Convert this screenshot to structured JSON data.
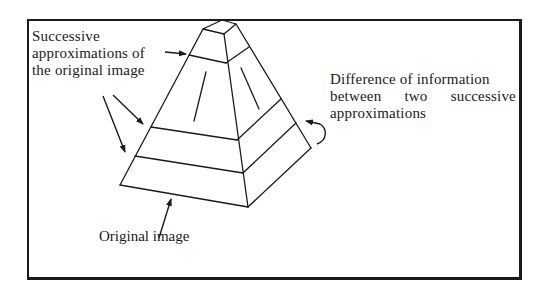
{
  "diagram": {
    "type": "image-pyramid",
    "labels": {
      "successive_approximations": [
        "Successive",
        "approximations of",
        "the original image"
      ],
      "difference_information": {
        "line1": "Difference of information",
        "line2_words": [
          "between",
          "two",
          "successive"
        ],
        "line3": "approximations"
      },
      "original_image": "Original image"
    },
    "colors": {
      "stroke": "#1a1a1a",
      "background": "#ffffff"
    }
  }
}
